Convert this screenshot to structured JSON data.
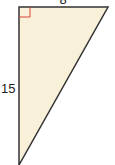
{
  "figure": {
    "type": "right-triangle",
    "labels": {
      "top": "8",
      "left": "15"
    },
    "colors": {
      "fill": "#f8f0d8",
      "stroke": "#333333",
      "right_angle_marker": "#d9463a"
    }
  }
}
